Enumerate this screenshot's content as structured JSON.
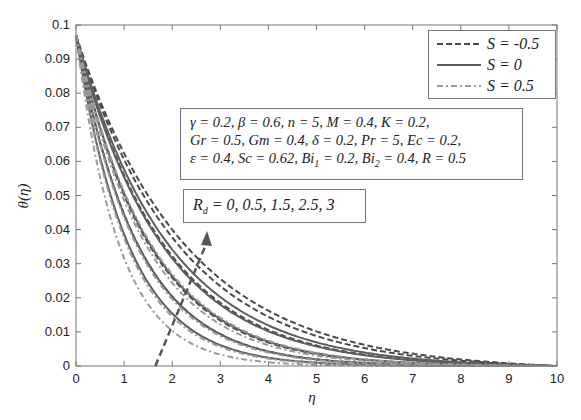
{
  "chart_data": {
    "type": "line",
    "xlabel": "η",
    "ylabel": "θ(η)",
    "xlim": [
      0,
      10
    ],
    "ylim": [
      0,
      0.1
    ],
    "xticks": [
      "0",
      "1",
      "2",
      "3",
      "4",
      "5",
      "6",
      "7",
      "8",
      "9",
      "10"
    ],
    "yticks": [
      "0",
      "0.01",
      "0.02",
      "0.03",
      "0.04",
      "0.05",
      "0.06",
      "0.07",
      "0.08",
      "0.09",
      "0.1"
    ],
    "grid": false,
    "legend_position": "upper right",
    "legend": [
      {
        "label": "S = -0.5",
        "style": "dashed",
        "color": "#4a4a4a"
      },
      {
        "label": "S = 0",
        "style": "solid",
        "color": "#5e5e5e"
      },
      {
        "label": "S = 0.5",
        "style": "dashdot",
        "color": "#9a9a9a"
      }
    ],
    "theta0": 0.097,
    "parameter_varied": "R_d",
    "rd_values": [
      0,
      0.5,
      1.5,
      2.5,
      3
    ],
    "series": [
      {
        "name": "S = -0.5",
        "style": "dashed",
        "decay_rates": [
          0.78,
          0.66,
          0.55,
          0.47,
          0.44
        ]
      },
      {
        "name": "S = 0",
        "style": "solid",
        "decay_rates": [
          0.92,
          0.78,
          0.65,
          0.56,
          0.52
        ]
      },
      {
        "name": "S = 0.5",
        "style": "dashdot",
        "decay_rates": [
          1.12,
          0.95,
          0.8,
          0.69,
          0.64
        ]
      }
    ],
    "annotations": [
      {
        "text": "R_d = 0, 0.5, 1.5, 2.5, 3",
        "arrow_from": [
          1.65,
          0.0
        ],
        "arrow_to": [
          2.7,
          0.04
        ]
      }
    ]
  },
  "params_box": {
    "line1": "γ = 0.2, β = 0.6, n = 5, M = 0.4, K = 0.2,",
    "line2": "Gr = 0.5, Gm = 0.4, δ = 0.2, Pr = 5, Ec = 0.2,",
    "line3_a": "ε = 0.4, Sc = 0.62, Bi",
    "line3_sub1": "1",
    "line3_b": " = 0.2, Bi",
    "line3_sub2": "2",
    "line3_c": " = 0.4, R = 0.5"
  },
  "rd_box": {
    "prefix": "R",
    "sub": "d",
    "text": " = 0, 0.5, 1.5, 2.5, 3"
  },
  "legend": {
    "items": [
      "S = -0.5",
      "S = 0",
      "S = 0.5"
    ]
  }
}
